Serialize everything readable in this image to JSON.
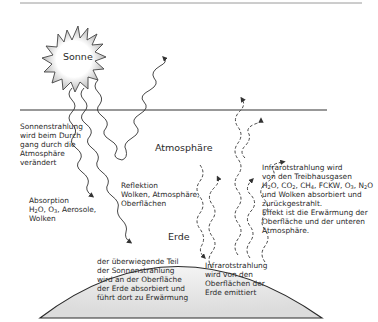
{
  "diagram": {
    "title_labels": {
      "sun": "Sonne",
      "atmosphere": "Atmosphäre",
      "earth": "Erde"
    },
    "annotations": {
      "sun_radiation": [
        "Sonnenstrahlung",
        "wird beim Durch",
        "gang durch die",
        "Atmosphäre",
        "verändert"
      ],
      "absorption": [
        "Absorption",
        "H2O, O3, Aerosole,",
        "Wolken"
      ],
      "absorption_title": "Absorption",
      "absorption_gases": {
        "h": "H",
        "h_sub": "2",
        "o": "O, O",
        "o_sub": "3",
        "rest": ", Aerosole,"
      },
      "absorption_last": "Wolken",
      "reflection": [
        "Reflektion",
        "Wolken, Atmosphäre,",
        "Oberflächen"
      ],
      "surface_absorption": [
        "der überwiegende Teil",
        "der Sonnenstrahlung",
        "wird an der Oberfläche",
        "der Erde absorbiert und",
        "führt dort zu Erwärmung"
      ],
      "infrared_emitted": [
        "Infrarotstrahlung",
        "wird von den",
        "Oberflächen der",
        "Erde emittiert"
      ],
      "greenhouse": {
        "line1": "Infrarotstrahlung wird",
        "line2": "von den Treibhausgasen",
        "line3_parts": [
          "H",
          "2",
          "O, CO",
          "2",
          ", CH",
          "4",
          ", FCKW, O",
          "3",
          ", N",
          "2",
          "O"
        ],
        "line4": "und Wolken absorbiert und",
        "line5": "zurückgestrahlt.",
        "line6": "Effekt ist die Erwärmung der",
        "line7": "Oberfläche und der unteren",
        "line8": "Atmosphäre."
      }
    },
    "colors": {
      "line": "#333333",
      "earth_fill": "#e6e6e6",
      "sun_glow": "#bdbdbd",
      "top_rule": "#9a9a9a"
    }
  }
}
